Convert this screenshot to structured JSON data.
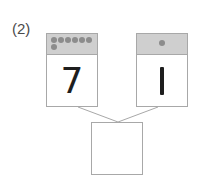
{
  "problem": {
    "label": "(2)",
    "left_card": {
      "number": "7",
      "dot_count": 7,
      "dots": [
        1,
        1,
        1,
        1,
        1,
        1,
        1
      ]
    },
    "right_card": {
      "number": "1",
      "dot_count": 1,
      "dots": [
        1
      ]
    },
    "answer_box": {
      "value": ""
    }
  },
  "colors": {
    "border": "#a8a8a8",
    "header": "#cfcfcf",
    "dot": "#8c8c8c",
    "text": "#1e1e1e"
  }
}
